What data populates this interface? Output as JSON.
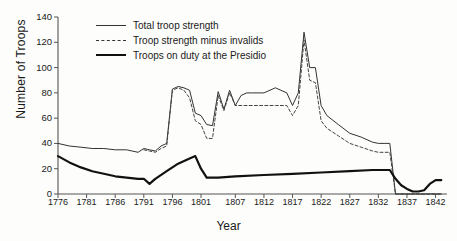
{
  "chart_data": {
    "type": "line",
    "title": "",
    "xlabel": "Year",
    "ylabel": "Number of Troops",
    "xlim": [
      1776,
      1844
    ],
    "ylim": [
      0,
      140
    ],
    "grid": false,
    "legend_position": "top-left",
    "xticks": [
      1776,
      1781,
      1786,
      1791,
      1796,
      1801,
      1807,
      1812,
      1817,
      1822,
      1827,
      1832,
      1837,
      1842
    ],
    "yticks": [
      0,
      20,
      40,
      60,
      80,
      100,
      120,
      140
    ],
    "series": [
      {
        "name": "Total troop strength",
        "style": "thin-solid",
        "color": "#333333",
        "x": [
          1776,
          1778,
          1780,
          1782,
          1784,
          1786,
          1788,
          1790,
          1791,
          1792,
          1793,
          1794,
          1795,
          1796,
          1797,
          1798,
          1799,
          1800,
          1801,
          1802,
          1803,
          1804,
          1805,
          1806,
          1807,
          1808,
          1809,
          1810,
          1812,
          1814,
          1816,
          1817,
          1818,
          1819,
          1820,
          1821,
          1822,
          1823,
          1825,
          1827,
          1829,
          1831,
          1832,
          1833,
          1834,
          1835,
          1843
        ],
        "y": [
          40,
          38,
          37,
          36,
          36,
          35,
          35,
          33,
          36,
          35,
          34,
          38,
          40,
          83,
          85,
          84,
          82,
          64,
          62,
          55,
          54,
          81,
          67,
          82,
          70,
          78,
          80,
          80,
          80,
          84,
          80,
          70,
          80,
          128,
          100,
          100,
          70,
          62,
          55,
          48,
          45,
          41,
          40,
          40,
          40,
          0,
          0
        ]
      },
      {
        "name": "Troop strength minus invalids",
        "style": "dashed",
        "color": "#444444",
        "x": [
          1791,
          1792,
          1793,
          1794,
          1795,
          1796,
          1797,
          1798,
          1799,
          1800,
          1801,
          1802,
          1803,
          1804,
          1805,
          1806,
          1807,
          1808,
          1810,
          1812,
          1814,
          1816,
          1817,
          1818,
          1819,
          1820,
          1821,
          1822,
          1823,
          1825,
          1827,
          1829,
          1831,
          1832,
          1833,
          1834,
          1835,
          1843
        ],
        "y": [
          35,
          34,
          33,
          36,
          38,
          82,
          84,
          82,
          76,
          58,
          55,
          44,
          44,
          78,
          66,
          80,
          70,
          70,
          70,
          70,
          70,
          70,
          62,
          70,
          122,
          90,
          88,
          58,
          52,
          46,
          40,
          37,
          34,
          33,
          33,
          33,
          0,
          0
        ]
      },
      {
        "name": "Troops on duty at the Presidio",
        "style": "bold-solid",
        "color": "#111111",
        "x": [
          1776,
          1778,
          1780,
          1782,
          1784,
          1786,
          1788,
          1790,
          1791,
          1792,
          1793,
          1795,
          1797,
          1799,
          1800,
          1801,
          1802,
          1804,
          1807,
          1812,
          1817,
          1822,
          1827,
          1831,
          1833,
          1834,
          1835,
          1836,
          1837,
          1838,
          1839,
          1840,
          1841,
          1842,
          1843
        ],
        "y": [
          30,
          25,
          21,
          18,
          16,
          14,
          13,
          12,
          12,
          8,
          12,
          18,
          24,
          28,
          30,
          20,
          13,
          13,
          14,
          15,
          16,
          17,
          18,
          19,
          19,
          19,
          12,
          7,
          4,
          2,
          2,
          3,
          8,
          11,
          11
        ]
      }
    ]
  },
  "legend": {
    "items": [
      {
        "label": "Total troop strength"
      },
      {
        "label": "Troop strength minus invalids"
      },
      {
        "label": "Troops on duty at the Presidio"
      }
    ]
  },
  "axes": {
    "y_title": "Number of Troops",
    "x_title": "Year"
  }
}
